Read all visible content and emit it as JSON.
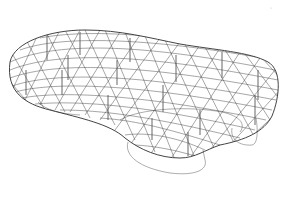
{
  "figure": {
    "background": "#ffffff",
    "mesh_color": "#3a3a3a",
    "footprint_color": "#8a8a8a",
    "column_color": "#555555"
  }
}
